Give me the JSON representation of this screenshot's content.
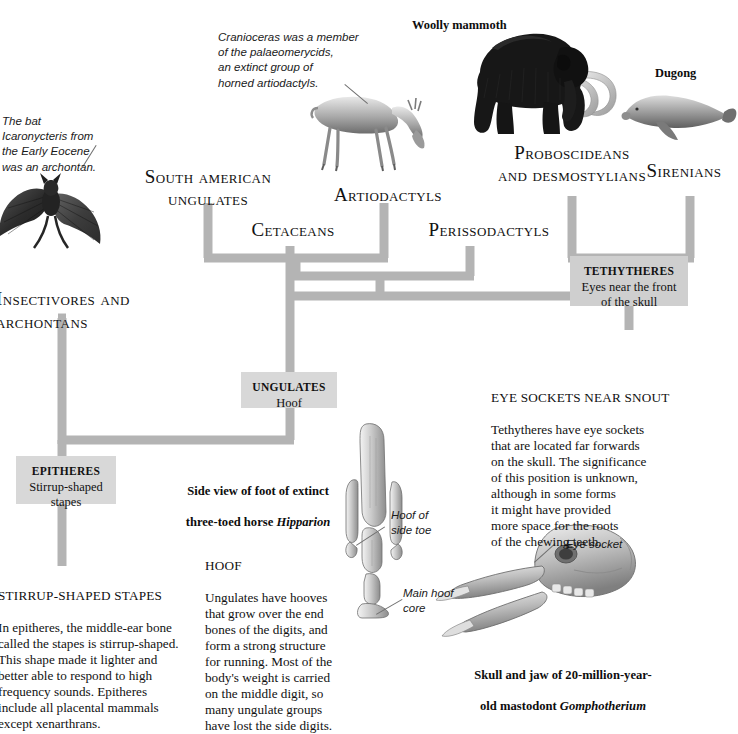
{
  "figure": {
    "kind": "cladogram-plate",
    "taxa": [
      {
        "id": "insectivores-archontans",
        "label": "Insectivores and\narchontans"
      },
      {
        "id": "south-american-ungulates",
        "label": "South american\nungulates"
      },
      {
        "id": "cetaceans",
        "label": "Cetaceans"
      },
      {
        "id": "artiodactyls",
        "label": "Artiodactyls"
      },
      {
        "id": "perissodactyls",
        "label": "Perissodactyls"
      },
      {
        "id": "proboscideans-desmostylians",
        "label": "Proboscideans\nand desmostylians"
      },
      {
        "id": "sirenians",
        "label": "Sirenians"
      }
    ],
    "nodes": [
      {
        "id": "tethytheres",
        "title": "TETHYTHERES",
        "trait": "Eyes near the front\nof the skull"
      },
      {
        "id": "ungulates",
        "title": "UNGULATES",
        "trait": "Hoof"
      },
      {
        "id": "epitheres",
        "title": "EPITHERES",
        "trait": "Stirrup-shaped\nstapes"
      }
    ],
    "specimen_labels": [
      {
        "id": "woolly-mammoth",
        "label": "Woolly mammoth"
      },
      {
        "id": "dugong",
        "label": "Dugong"
      }
    ],
    "annotations": [
      {
        "id": "bat-note",
        "text": "The bat\nIcaronycteris from\nthe Early Eocene\nwas an archontan."
      },
      {
        "id": "cranioceras-note",
        "text": "Cranioceras was a member\nof the palaeomerycids,\nan extinct group of\nhorned artiodactyls."
      },
      {
        "id": "hoof-of-side-toe",
        "text": "Hoof of\nside toe"
      },
      {
        "id": "main-hoof-core",
        "text": "Main hoof\ncore"
      },
      {
        "id": "eye-socket",
        "text": "Eye socket"
      }
    ],
    "text_blocks": [
      {
        "id": "eye-sockets-near-snout",
        "heading": "EYE SOCKETS NEAR SNOUT",
        "body": "Tethytheres have eye sockets\nthat are located far forwards\non the skull. The significance\nof this position is unknown,\nalthough in some forms\nit might have provided\nmore space for the roots\nof the chewing teeth."
      },
      {
        "id": "hoof",
        "heading": "HOOF",
        "body": "Ungulates have hooves\nthat grow over the end\nbones of the digits, and\nform a strong structure\nfor running. Most of the\nbody's weight is carried\non the middle digit, so\nmany ungulate groups\nhave lost the side digits."
      },
      {
        "id": "stirrup-shaped-stapes",
        "heading": "STIRRUP-SHAPED STAPES",
        "body": "In epitheres, the middle-ear bone\ncalled the stapes is stirrup-shaped.\nThis shape made it lighter and\nbetter able to respond to high\nfrequency sounds. Epitheres\ninclude all placental mammals\nexcept xenarthrans."
      }
    ],
    "captions": [
      {
        "id": "hipparion-foot-caption",
        "line1": "Side view of foot of extinct",
        "line2_plain": "three-toed horse ",
        "line2_italic": "Hipparion"
      },
      {
        "id": "gomphotherium-skull-caption",
        "line1": "Skull and jaw of 20-million-year-",
        "line2_plain": "old mastodont ",
        "line2_italic": "Gomphotherium"
      }
    ],
    "colors": {
      "branch": "#b4b4b4",
      "box_fill": "#cfcfcf",
      "box_fill_light": "#d8d8d8",
      "text": "#111111",
      "leader": "#6f6f6f",
      "background": "#ffffff"
    }
  }
}
